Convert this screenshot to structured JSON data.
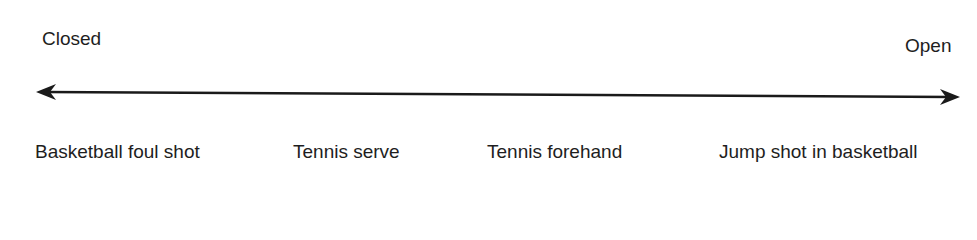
{
  "diagram": {
    "type": "continuum",
    "left_label": "Closed",
    "right_label": "Open",
    "items": [
      {
        "label": "Basketball foul shot"
      },
      {
        "label": "Tennis serve"
      },
      {
        "label": "Tennis forehand"
      },
      {
        "label": "Jump shot in basketball"
      }
    ]
  }
}
